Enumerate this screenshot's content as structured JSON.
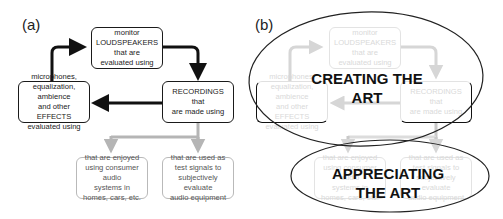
{
  "panel_a": {
    "label": "(a)",
    "boxes": {
      "loudspeakers": "monitor\nLOUDSPEAKERS\nthat are\nevaluated using",
      "effects": "microphones,\nequalization,\nambience\nand other EFFECTS\nevaluated using",
      "recordings": "RECORDINGS that\nare made using",
      "enjoyed": "that are enjoyed\nusing consumer audio\nsystems in\nhomes, cars, etc.",
      "test_signals": "that are used as\ntest signals to\nsubjectively evaluate\naudio equipment"
    }
  },
  "panel_b": {
    "label": "(b)",
    "boxes": {
      "loudspeakers": "monitor\nLOUDSPEAKERS\nthat are\nevaluated using",
      "effects": "microphones,\nequalization,\nambience\nand other EFFECTS\nevaluated using",
      "recordings": "RECORDINGS that\nare made using",
      "enjoyed": "that are enjoyed\nusing consumer audio\nsystems in\nhomes, cars, etc.",
      "test_signals": "that are used as\ntest signals to\nsubjectively evaluate\naudio equipment"
    },
    "ellipse_creating": "CREATING THE ART",
    "ellipse_appreciating": "APPRECIATING\nTHE ART"
  },
  "colors": {
    "dark_stroke": "#1a1a1a",
    "gray_stroke": "#b9b9b9",
    "faint_stroke": "#e3e3e3"
  }
}
